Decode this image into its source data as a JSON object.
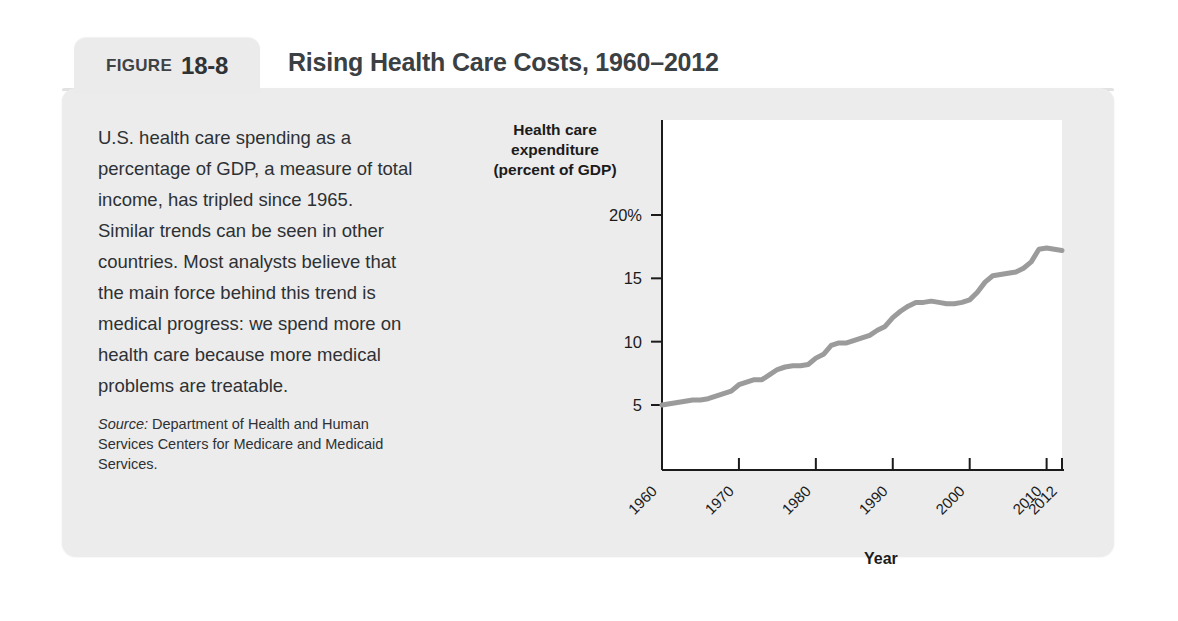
{
  "figure": {
    "tab_label": "FIGURE",
    "tab_number": "18-8",
    "title": "Rising Health Care Costs, 1960–2012"
  },
  "description": {
    "body": "U.S. health care spending as a percentage of GDP, a measure of total income, has tripled since 1965. Similar trends can be seen in other countries. Most analysts believe that the main force behind this trend is medical progress: we spend more on health care because more medical problems are treatable.",
    "source_label": "Source:",
    "source_text": " Department of Health and Human Services Centers for Medicare and Medicaid Services."
  },
  "colors": {
    "card_background": "#ececed",
    "plot_background": "#ffffff",
    "line": "#9b9b9b",
    "axis": "#1b1b1b",
    "text": "#2e3133"
  },
  "chart_data": {
    "type": "line",
    "title": "Rising Health Care Costs, 1960–2012",
    "xlabel": "Year",
    "ylabel": "Health care expenditure (percent of GDP)",
    "ylabel_lines": [
      "Health care",
      "expenditure",
      "(percent of GDP)"
    ],
    "grid": false,
    "legend": "none",
    "xlim": [
      1960,
      2012
    ],
    "ylim": [
      0,
      21
    ],
    "ytick_values": [
      5,
      10,
      15,
      20
    ],
    "ytick_labels": [
      "5",
      "10",
      "15",
      "20%"
    ],
    "xtick_values": [
      1960,
      1970,
      1980,
      1990,
      2000,
      2010,
      2012
    ],
    "xtick_labels": [
      "1960",
      "1970",
      "1980",
      "1990",
      "2000",
      "2010",
      "2012"
    ],
    "series": [
      {
        "name": "Health care expenditure (percent of GDP)",
        "x": [
          1960,
          1961,
          1962,
          1963,
          1964,
          1965,
          1966,
          1967,
          1968,
          1969,
          1970,
          1971,
          1972,
          1973,
          1974,
          1975,
          1976,
          1977,
          1978,
          1979,
          1980,
          1981,
          1982,
          1983,
          1984,
          1985,
          1986,
          1987,
          1988,
          1989,
          1990,
          1991,
          1992,
          1993,
          1994,
          1995,
          1996,
          1997,
          1998,
          1999,
          2000,
          2001,
          2002,
          2003,
          2004,
          2005,
          2006,
          2007,
          2008,
          2009,
          2010,
          2011,
          2012
        ],
        "values": [
          5.0,
          5.1,
          5.2,
          5.3,
          5.4,
          5.4,
          5.5,
          5.7,
          5.9,
          6.1,
          6.6,
          6.8,
          7.0,
          7.0,
          7.4,
          7.8,
          8.0,
          8.1,
          8.1,
          8.2,
          8.7,
          9.0,
          9.7,
          9.9,
          9.9,
          10.1,
          10.3,
          10.5,
          10.9,
          11.2,
          11.9,
          12.4,
          12.8,
          13.1,
          13.1,
          13.2,
          13.1,
          13.0,
          13.0,
          13.1,
          13.3,
          13.9,
          14.7,
          15.2,
          15.3,
          15.4,
          15.5,
          15.8,
          16.3,
          17.3,
          17.4,
          17.3,
          17.2
        ]
      }
    ]
  }
}
